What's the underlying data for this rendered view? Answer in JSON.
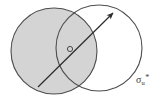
{
  "figure": {
    "type": "two-overlapping-circles-with-arrow",
    "background_color": "#ffffff",
    "stroke_color": "#4d4d4d",
    "shaded_fill_color": "#d4d4d4",
    "arrow_color": "#2b2b2b",
    "labels": {
      "sigma_symbol": "σ",
      "sigma_subscript": "u",
      "sigma_superscript": "*",
      "sigma_full": "σu*"
    },
    "shapes": {
      "shaded_circle": {
        "name": "shaded-circle",
        "center_x": 54,
        "center_y": 51,
        "radius": 43,
        "filled": true
      },
      "open_circle": {
        "name": "open-circle",
        "center_x": 99,
        "center_y": 48,
        "radius": 43,
        "filled": false
      },
      "center_marker": {
        "name": "center-marker",
        "center_x": 70,
        "center_y": 49,
        "radius": 2.6
      },
      "arrow": {
        "name": "direction-arrow",
        "tail_x": 38,
        "tail_y": 87,
        "tip_x": 113,
        "tip_y": 13
      }
    }
  }
}
